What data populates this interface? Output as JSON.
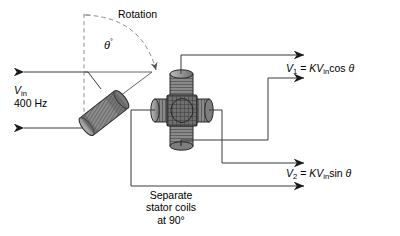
{
  "figure": {
    "background_color": "#ffffff",
    "line_color": "#3a3a3a",
    "text_color": "#000000"
  },
  "labels": {
    "rotation": "Rotation",
    "theta_symbol": "θ",
    "theta_degree": "°",
    "input_voltage_symbol": "V",
    "input_voltage_subscript": "in",
    "input_frequency": "400 Hz",
    "separate_line1": "Separate",
    "separate_line2": "stator coils",
    "separate_line3": "at 90°"
  },
  "outputs": [
    {
      "name": "v1",
      "symbol": "V",
      "subscript": "1",
      "equals": "=",
      "gain": "K",
      "source_symbol": "V",
      "source_subscript": "in",
      "function": "cos",
      "angle": "θ",
      "full_text": "V1 = KVin cos θ"
    },
    {
      "name": "v2",
      "symbol": "V",
      "subscript": "2",
      "equals": "=",
      "gain": "K",
      "source_symbol": "V",
      "source_subscript": "in",
      "function": "sin",
      "angle": "θ",
      "full_text": "V2 = KVin sin θ"
    }
  ],
  "components": {
    "rotor_coil": "rotor-coil",
    "stator_assembly": "stator-coil-assembly",
    "stator_coil_count": 4,
    "rotation_arc": "rotation-arc-dashed",
    "reference_axis": "vertical-dashed-reference-axis"
  }
}
